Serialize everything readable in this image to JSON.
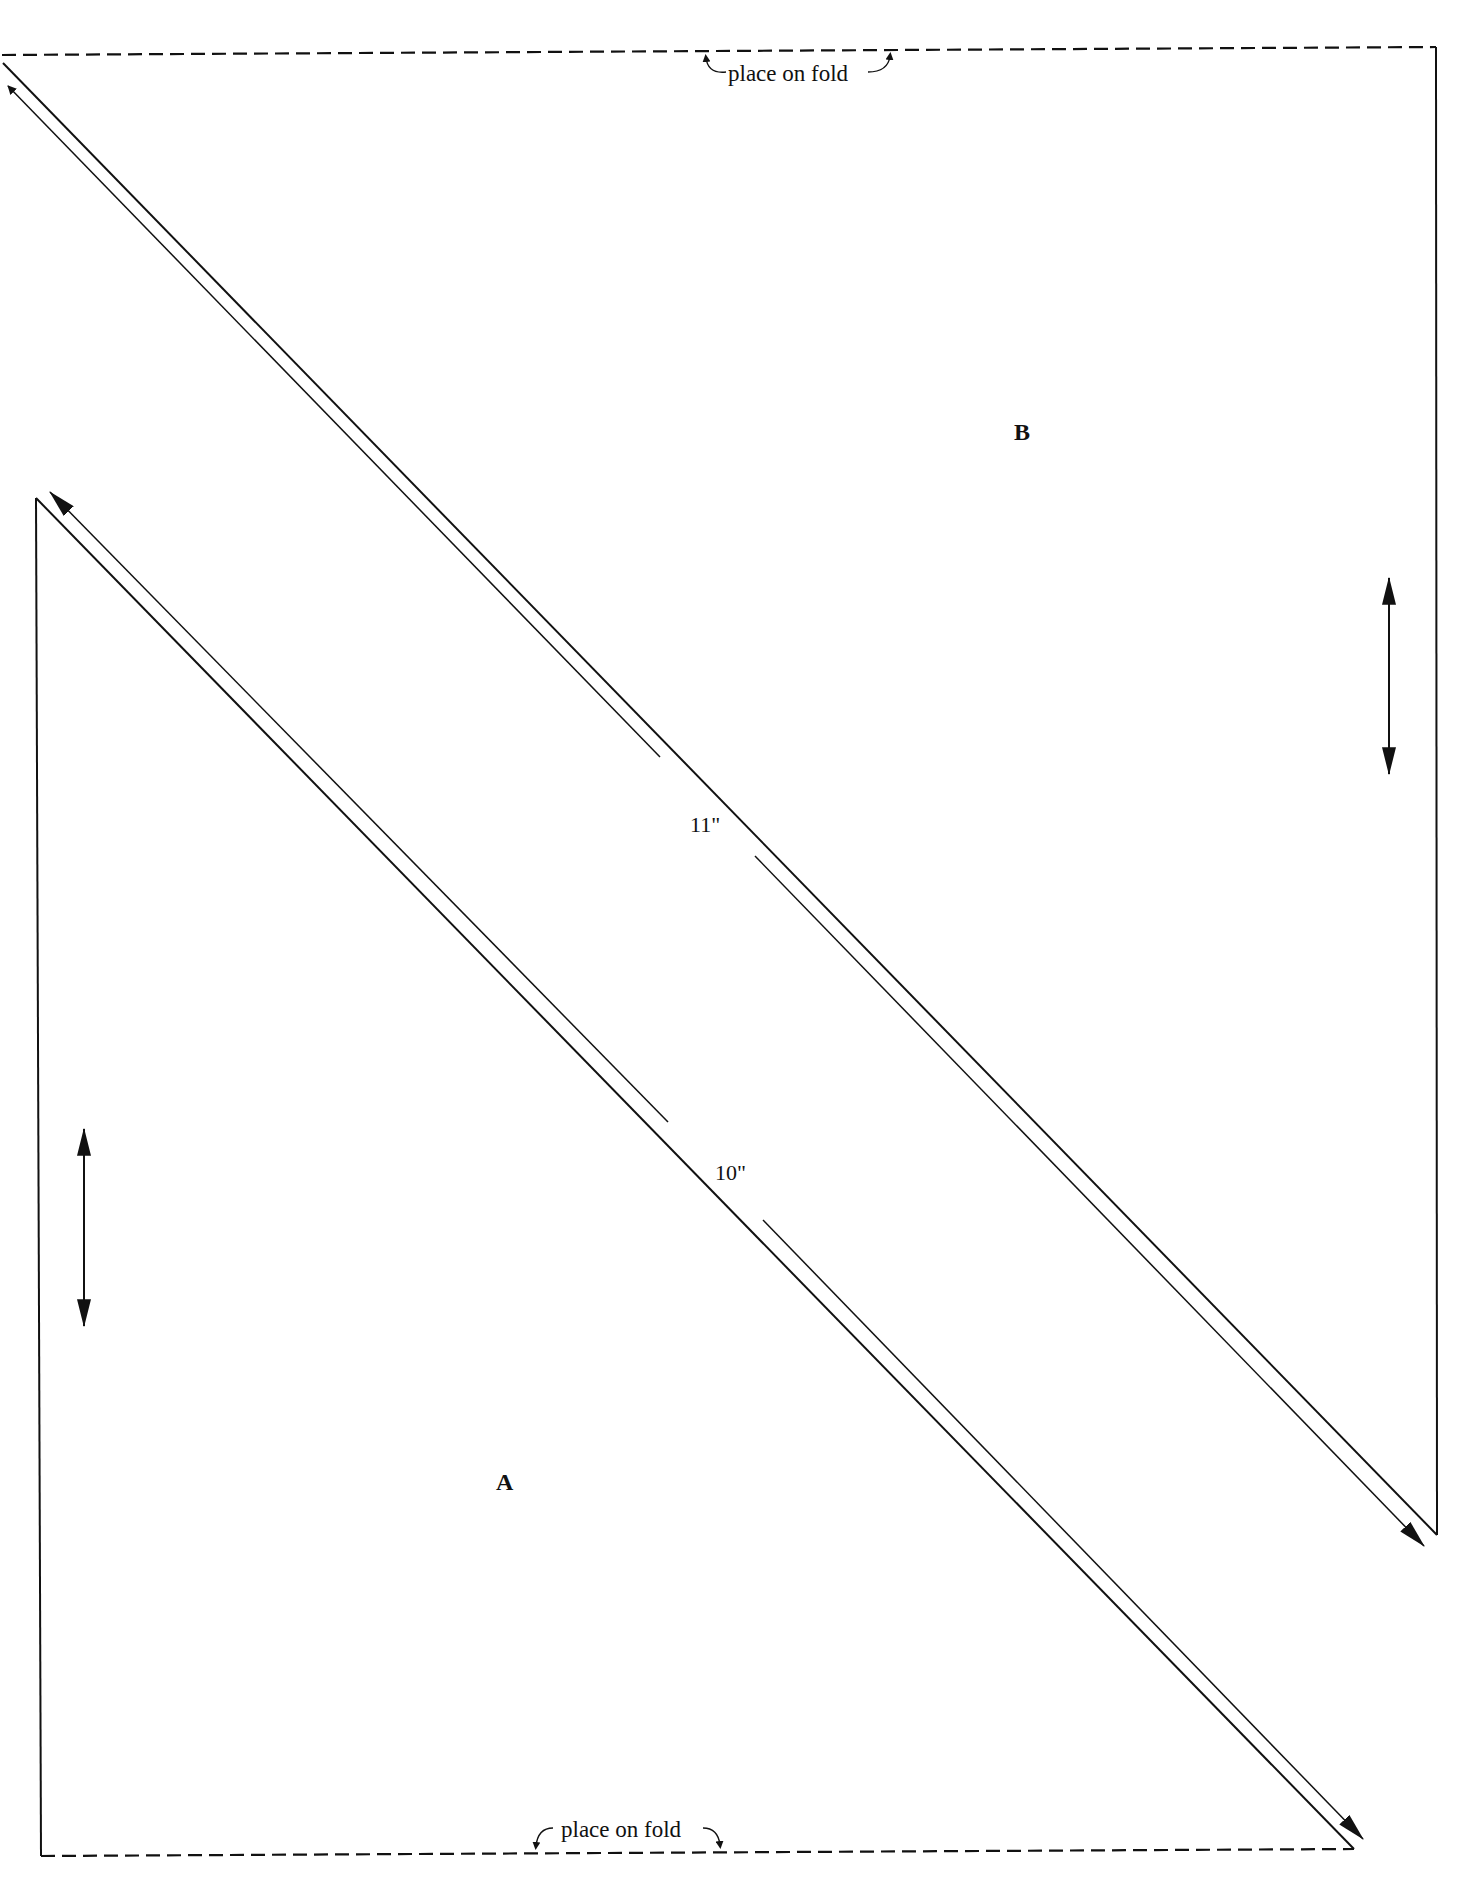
{
  "diagram": {
    "type": "sewing-pattern",
    "colors": {
      "line": "#111111",
      "background": "#ffffff"
    },
    "pieces": [
      {
        "id": "B",
        "label": "B",
        "shape": "triangle",
        "fold_label": "place on fold",
        "dimension_label": "11\"",
        "grainline": "vertical double arrow"
      },
      {
        "id": "A",
        "label": "A",
        "shape": "triangle",
        "fold_label": "place on fold",
        "dimension_label": "10\"",
        "grainline": "vertical double arrow"
      }
    ]
  },
  "labels": {
    "top_fold": "place on fold",
    "bottom_fold": "place on fold",
    "piece_b": "B",
    "piece_a": "A",
    "dim_b": "11\"",
    "dim_a": "10\""
  }
}
